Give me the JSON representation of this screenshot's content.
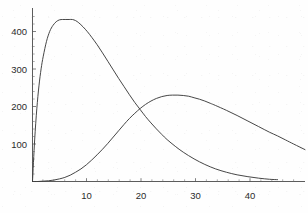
{
  "chart_data": {
    "type": "line",
    "title": "",
    "subtitle": "",
    "xlabel": "",
    "ylabel": "",
    "xlim": [
      0,
      50.6
    ],
    "ylim": [
      0,
      468
    ],
    "grid": false,
    "legend": "none",
    "annotations": [],
    "xticks": [
      10,
      20,
      30,
      40
    ],
    "xtick_labels": [
      "10",
      "20",
      "30",
      "40"
    ],
    "yticks": [
      100,
      200,
      300,
      400
    ],
    "ytick_labels": [
      "100",
      "200",
      "300",
      "400"
    ],
    "x_minor_tick_step": 2,
    "y_minor_tick_step": 20,
    "series": [
      {
        "name": "curve-1",
        "color": "#3c3c3c",
        "peak_x": 7.4,
        "peak_y": 437,
        "x": [
          0.0,
          0.4,
          0.8,
          1.2,
          1.6,
          2.0,
          2.6,
          3.2,
          3.8,
          4.4,
          5.0,
          5.6,
          6.2,
          6.8,
          7.4,
          8.0,
          8.6,
          9.4,
          10.2,
          11.0,
          12.0,
          13.0,
          14.0,
          15.0,
          16.0,
          17.0,
          18.0,
          19.0,
          20.0,
          21.0,
          22.0,
          23.0,
          24.0,
          25.0,
          26.5,
          28.0,
          30.0,
          32.0,
          34.0,
          36.0,
          38.0,
          40.0,
          42.0,
          44.0,
          45.5
        ],
        "y": [
          0,
          112,
          196,
          258,
          304,
          338,
          378,
          405,
          421,
          431,
          436,
          437,
          437,
          437,
          437,
          434,
          428,
          417,
          404,
          389,
          369,
          347,
          324,
          301,
          278,
          256,
          234,
          213,
          194,
          175,
          158,
          142,
          127,
          113,
          95,
          79,
          61,
          46,
          34,
          25,
          18,
          13,
          9,
          6,
          5
        ]
      },
      {
        "name": "curve-2",
        "color": "#3c3c3c",
        "peak_x": 27.0,
        "peak_y": 233,
        "x": [
          0.0,
          1.0,
          2.0,
          3.0,
          4.0,
          5.0,
          6.0,
          7.0,
          8.0,
          9.0,
          10.0,
          11.0,
          12.0,
          13.0,
          14.0,
          15.0,
          16.0,
          17.0,
          18.0,
          19.0,
          20.0,
          21.0,
          22.0,
          23.0,
          24.0,
          25.0,
          26.0,
          27.0,
          28.0,
          29.0,
          30.0,
          31.0,
          32.0,
          33.0,
          34.0,
          36.0,
          38.0,
          40.0,
          42.0,
          44.0,
          45.5,
          47.0,
          48.5,
          50.6
        ],
        "y": [
          0,
          0,
          1,
          2,
          4,
          7,
          11,
          17,
          25,
          34,
          45,
          58,
          72,
          87,
          103,
          120,
          137,
          154,
          170,
          184,
          197,
          208,
          217,
          224,
          229,
          232,
          233,
          233,
          232,
          230,
          226,
          222,
          217,
          211,
          205,
          192,
          178,
          163,
          148,
          133,
          123,
          112,
          101,
          86
        ]
      }
    ],
    "crossing_point": {
      "x": 21.6,
      "y": 190
    }
  },
  "axes": {
    "x_axis_name": "x-axis",
    "y_axis_name": "y-axis"
  }
}
